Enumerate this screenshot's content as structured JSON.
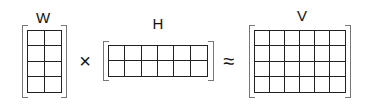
{
  "diagram": {
    "colors": {
      "grid_line": "#222222",
      "bracket": "#777777",
      "text": "#111111",
      "background": "#ffffff"
    },
    "matrices": [
      {
        "id": "W",
        "label": "W",
        "rows": 4,
        "cols": 2
      },
      {
        "id": "H",
        "label": "H",
        "rows": 2,
        "cols": 6
      },
      {
        "id": "V",
        "label": "V",
        "rows": 4,
        "cols": 6
      }
    ],
    "operators": {
      "multiply": "×",
      "approx": "≈"
    }
  }
}
